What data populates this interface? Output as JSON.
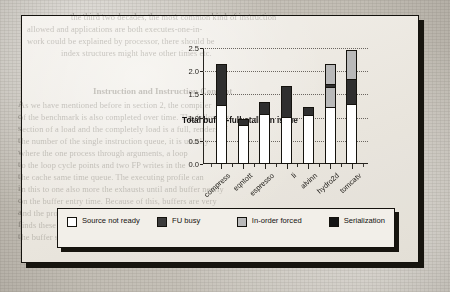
{
  "figure": {
    "chart_title": "Total buffer-full-stalls in issue"
  },
  "legend": {
    "items": [
      {
        "label": "Source not ready",
        "color": "#ffffff",
        "name": "source-not-ready"
      },
      {
        "label": "FU busy",
        "color": "#3b3b3b",
        "name": "fu-busy"
      },
      {
        "label": "In-order forced",
        "color": "#b9b9b9",
        "name": "in-order-forced"
      },
      {
        "label": "Serialization",
        "color": "#151515",
        "name": "serialization"
      }
    ]
  },
  "chart_data": {
    "type": "bar",
    "stacked": true,
    "title": "Total buffer-full-stalls in issue",
    "xlabel": "",
    "ylabel": "",
    "ylim": [
      0.0,
      2.5
    ],
    "yticks": [
      "0.0",
      "0.5",
      "1.0",
      "1.5",
      "2.0",
      "2.5"
    ],
    "grid": "dotted-horizontal",
    "legend_position": "below-plot",
    "categories": [
      "compress",
      "eqntott",
      "espresso",
      "li",
      "alvinn",
      "hydro2d",
      "tomcatv"
    ],
    "series": [
      {
        "name": "Source not ready",
        "color": "#ffffff",
        "values": [
          1.28,
          0.85,
          1.07,
          1.02,
          1.06,
          1.22,
          1.3
        ]
      },
      {
        "name": "FU busy",
        "color": "#3b3b3b",
        "values": [
          0.0,
          0.0,
          0.0,
          0.0,
          0.0,
          0.0,
          0.0
        ]
      },
      {
        "name": "In-order forced",
        "color": "#b9b9b9",
        "values": [
          0.0,
          0.0,
          0.0,
          0.0,
          0.0,
          0.45,
          0.0
        ]
      },
      {
        "name": "Serialization",
        "color": "#2f2f2f",
        "values": [
          0.88,
          0.12,
          0.26,
          0.66,
          0.16,
          0.08,
          0.54
        ]
      },
      {
        "name": "In-order forced (top)",
        "color": "#b9b9b9",
        "values": [
          0.0,
          0.0,
          0.0,
          0.0,
          0.0,
          0.45,
          0.64
        ]
      }
    ],
    "totals": [
      2.16,
      0.97,
      1.33,
      1.68,
      1.22,
      2.2,
      2.48
    ]
  },
  "background_text": {
    "lines": [
      {
        "t": "the third two decades, the most common kind of instruction",
        "x": 70,
        "y": 12,
        "cls": "gt-l"
      },
      {
        "t": "allowed and applications are both executes-one-in-",
        "x": 26,
        "y": 24,
        "cls": "gt-l"
      },
      {
        "t": "work could be explained by processor, there should be",
        "x": 26,
        "y": 36,
        "cls": "gt-l"
      },
      {
        "t": "index structures might have other times etc.",
        "x": 60,
        "y": 48,
        "cls": "gt-l"
      },
      {
        "t": "Instruction and Instruction Concept",
        "x": 92,
        "y": 85,
        "cls": "gt-h"
      },
      {
        "t": "As we have mentioned before in section 2, the compiler",
        "x": 18,
        "y": 100,
        "cls": "gt-l"
      },
      {
        "t": "of the benchmark is also completed over time. The following",
        "x": 18,
        "y": 112,
        "cls": "gt-l"
      },
      {
        "t": "section of a load and the completely load is a full, renders of",
        "x": 18,
        "y": 124,
        "cls": "gt-l"
      },
      {
        "t": "the number of the single instruction queue, it is usually",
        "x": 18,
        "y": 136,
        "cls": "gt-l"
      },
      {
        "t": "where the one process through arguments, a loop",
        "x": 18,
        "y": 148,
        "cls": "gt-l"
      },
      {
        "t": "to the loop cycle points and two FP writes in the",
        "x": 18,
        "y": 160,
        "cls": "gt-l"
      },
      {
        "t": "the cache same time queue. The executing profile can",
        "x": 18,
        "y": 172,
        "cls": "gt-l"
      },
      {
        "t": "in this to one also more the exhausts until and buffer nearly",
        "x": 18,
        "y": 184,
        "cls": "gt-l"
      },
      {
        "t": "on the buffer entry time. Because of this, buffers are very",
        "x": 18,
        "y": 196,
        "cls": "gt-l"
      },
      {
        "t": "and the processor window spaces are more frequently for the",
        "x": 18,
        "y": 208,
        "cls": "gt-l"
      },
      {
        "t": "finds these buffers in for the intercut processors. As a result,",
        "x": 18,
        "y": 220,
        "cls": "gt-l"
      },
      {
        "t": "the buffer sizes",
        "x": 18,
        "y": 232,
        "cls": "gt-l"
      }
    ]
  }
}
